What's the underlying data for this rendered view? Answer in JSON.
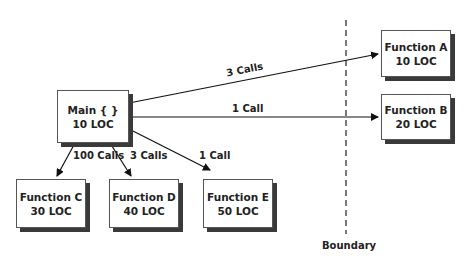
{
  "diagram": {
    "boundary_label": "Boundary",
    "nodes": {
      "main": {
        "name": "Main { }",
        "loc": "10 LOC"
      },
      "a": {
        "name": "Function A",
        "loc": "10 LOC"
      },
      "b": {
        "name": "Function B",
        "loc": "20 LOC"
      },
      "c": {
        "name": "Function C",
        "loc": "30 LOC"
      },
      "d": {
        "name": "Function D",
        "loc": "40 LOC"
      },
      "e": {
        "name": "Function E",
        "loc": "50 LOC"
      }
    },
    "edges": {
      "main_a": "3 Calls",
      "main_b": "1 Call",
      "main_c": "100 Calls",
      "main_d": "3 Calls",
      "main_e": "1 Call"
    }
  }
}
